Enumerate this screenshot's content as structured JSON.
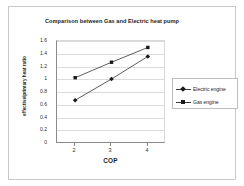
{
  "chart_data": {
    "type": "line",
    "title": "Comparison between Gas and Electric heat pump",
    "xlabel": "COP",
    "ylabel": "effective/primary heat ratio",
    "x": [
      2,
      3,
      4
    ],
    "xticklabels": [
      "2",
      "3",
      "4"
    ],
    "yticklabels": [
      "1.6",
      "1.4",
      "1.2",
      "1",
      "0.8",
      "0.6",
      "0.4",
      "0.2",
      "0"
    ],
    "ylim": [
      0,
      1.6
    ],
    "xlim": [
      1.5,
      4.5
    ],
    "grid": "horizontal",
    "legend_position": "right",
    "series": [
      {
        "name": "Electric engine",
        "marker": "diamond",
        "color": "#1a1a1a",
        "values": [
          0.68,
          1.01,
          1.36
        ]
      },
      {
        "name": "Gas engine",
        "marker": "square",
        "color": "#1a1a1a",
        "values": [
          1.03,
          1.27,
          1.5
        ]
      }
    ]
  },
  "colors": {
    "frame_border": "#c9c9c9",
    "axis": "#8a8a8a",
    "gridline": "#dcdcdc",
    "text": "#1b1b1b",
    "background": "#ffffff"
  }
}
